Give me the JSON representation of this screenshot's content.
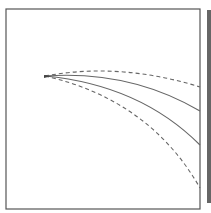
{
  "diagram": {
    "frame": {
      "x": 6,
      "y": 9,
      "width": 194,
      "height": 200,
      "stroke": "#555555"
    },
    "side_bar": {
      "x": 207,
      "y": 10,
      "width": 4,
      "height": 193,
      "fill": "#666666"
    },
    "origin": {
      "x": 45,
      "y": 76
    },
    "curves": [
      {
        "name": "upper-dashed-curve",
        "style": "dashed",
        "d": "M45,76 Q120,62 200,87"
      },
      {
        "name": "upper-solid-curve",
        "style": "solid",
        "d": "M45,76 Q130,70 200,111"
      },
      {
        "name": "lower-solid-curve",
        "style": "solid",
        "d": "M45,76 Q140,85 200,145"
      },
      {
        "name": "lower-dashed-curve",
        "style": "dashed",
        "d": "M45,76 Q150,100 200,188"
      }
    ],
    "stroke_color": "#666666"
  }
}
